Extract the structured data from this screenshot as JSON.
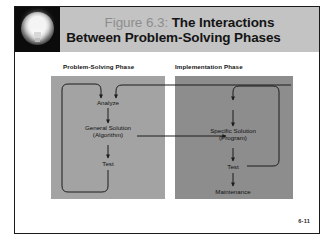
{
  "slide": {
    "icon": "lightbulb-icon",
    "title": {
      "figure_label": "Figure 6.3:",
      "line1_rest": " The Interactions",
      "line2": "Between Problem-Solving Phases"
    },
    "page_number": "6-11"
  },
  "diagram": {
    "panels": [
      {
        "id": "problem-solving",
        "caption": "Problem-Solving Phase",
        "fill": "#a3a3a3",
        "nodes": [
          {
            "id": "analyze",
            "label": "Analyze"
          },
          {
            "id": "general-solution",
            "line1": "General Solution",
            "line2": "(Algorithm)"
          },
          {
            "id": "test-left",
            "label": "Test"
          }
        ]
      },
      {
        "id": "implementation",
        "caption": "Implementation Phase",
        "fill": "#8d8d8d",
        "nodes": [
          {
            "id": "specific-solution",
            "line1": "Specific Solution",
            "line2": "(Program)"
          },
          {
            "id": "test-right",
            "label": "Test"
          },
          {
            "id": "maintenance",
            "label": "Maintenance"
          }
        ]
      }
    ]
  },
  "colors": {
    "header_band": "#c3c3c3",
    "icon_panel": "#0b0b0b",
    "panel_left": "#a3a3a3",
    "panel_right": "#8d8d8d",
    "slide_border": "#1a1a1a",
    "wire": "#1c1c1c"
  }
}
